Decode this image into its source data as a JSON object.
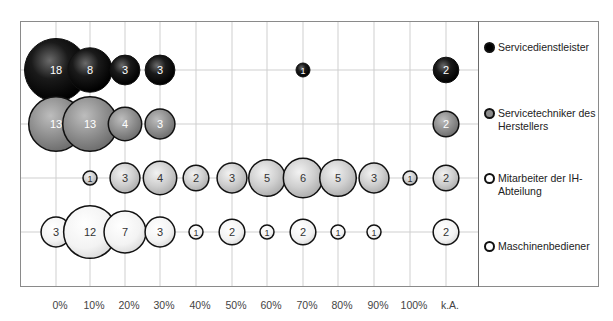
{
  "chart_data": {
    "type": "scatter",
    "subtype": "bubble",
    "title": "",
    "xlabel": "",
    "ylabel": "",
    "categories": [
      "0%",
      "10%",
      "20%",
      "30%",
      "40%",
      "50%",
      "60%",
      "70%",
      "80%",
      "90%",
      "100%",
      "k.A."
    ],
    "grid": true,
    "legend_position": "right",
    "series": [
      {
        "name": "Servicedienstleister",
        "color": "#000000",
        "values": [
          18,
          8,
          3,
          3,
          null,
          null,
          null,
          1,
          null,
          null,
          null,
          2
        ]
      },
      {
        "name": "Servicetechniker des Herstellers",
        "color": "#8c8c8c",
        "values": [
          13,
          13,
          4,
          3,
          null,
          null,
          null,
          null,
          null,
          null,
          null,
          2
        ]
      },
      {
        "name": "Mitarbeiter der IH-Abteilung",
        "color": "#c8c8c8",
        "values": [
          null,
          1,
          3,
          4,
          2,
          3,
          5,
          6,
          5,
          3,
          1,
          2
        ]
      },
      {
        "name": "Maschinenbediener",
        "color": "#f4f4f4",
        "values": [
          3,
          12,
          7,
          3,
          1,
          2,
          1,
          2,
          1,
          1,
          null,
          2
        ]
      }
    ]
  },
  "legend": {
    "items": [
      {
        "label": "Servicedienstleister",
        "marker_fill": "#000000"
      },
      {
        "label": "Servicetechniker des Herstellers",
        "marker_fill": "#8c8c8c"
      },
      {
        "label": "Mitarbeiter der IH-Abteilung",
        "marker_fill": "#ffffff"
      },
      {
        "label": "Maschinenbediener",
        "marker_fill": "#ffffff"
      }
    ]
  }
}
